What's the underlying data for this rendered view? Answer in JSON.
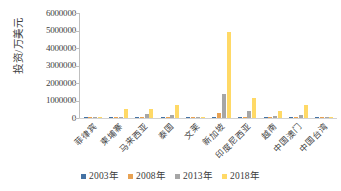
{
  "chart_data": {
    "type": "bar",
    "title": "",
    "subtitle": "",
    "xlabel": "",
    "ylabel": "投资/万美元",
    "ylim": [
      0,
      6000000
    ],
    "ytick_labels": [
      "6000000",
      "5000000",
      "4000000",
      "3000000",
      "2000000",
      "1000000",
      "0"
    ],
    "ytick_values": [
      6000000,
      5000000,
      4000000,
      3000000,
      2000000,
      1000000,
      0
    ],
    "grid": false,
    "legend_position": "bottom",
    "categories": [
      "菲律宾",
      "柬埔寨",
      "马来西亚",
      "泰国",
      "文莱",
      "新加坡",
      "印度尼西亚",
      "越南",
      "中国澳门",
      "中国台湾"
    ],
    "series": [
      {
        "name": "2003年",
        "color": "#4472a4",
        "values": [
          2000,
          1500,
          3000,
          2500,
          1000,
          8000,
          2000,
          3000,
          12000,
          1500
        ]
      },
      {
        "name": "2008年",
        "color": "#e8a253",
        "values": [
          4000,
          6000,
          30000,
          40000,
          2000,
          260000,
          20000,
          20000,
          80000,
          8000
        ]
      },
      {
        "name": "2013年",
        "color": "#a6a6a6",
        "values": [
          18000,
          35000,
          230000,
          150000,
          5000,
          1400000,
          400000,
          110000,
          200000,
          20000
        ]
      },
      {
        "name": "2018年",
        "color": "#ffd966",
        "values": [
          30000,
          520000,
          530000,
          760000,
          20000,
          4900000,
          1150000,
          400000,
          750000,
          60000
        ]
      }
    ]
  },
  "legend": {
    "items": [
      {
        "label": "2003年",
        "color": "#4472a4"
      },
      {
        "label": "2008年",
        "color": "#e8a253"
      },
      {
        "label": "2013年",
        "color": "#a6a6a6"
      },
      {
        "label": "2018年",
        "color": "#ffd966"
      }
    ]
  }
}
